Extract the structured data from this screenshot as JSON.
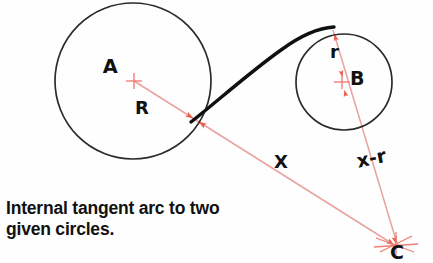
{
  "figure": {
    "title_caption": "Internal tangent arc to two\ngiven circles.",
    "background_color": "#fefefe",
    "line_color_construction": "#e8a2a0",
    "arrow_color": "#f0604f",
    "ink_color": "#1a1a1a",
    "circles": [
      {
        "name": "circle-A",
        "center_label": "A",
        "cx": 133,
        "cy": 81,
        "r": 78,
        "radius_label": "R"
      },
      {
        "name": "circle-B",
        "center_label": "B",
        "cx": 344,
        "cy": 82,
        "r": 48,
        "radius_label": "r"
      }
    ],
    "labels": {
      "center_a": "A",
      "radius_a": "R",
      "center_b": "B",
      "radius_b": "r",
      "distance_x": "X",
      "distance_x_minus_r": "x-r",
      "arc_center": "C"
    },
    "tangent_arc": {
      "name": "internal-tangent-arc",
      "tangent_point_a": {
        "x": 192,
        "y": 120
      },
      "tangent_point_b": {
        "x": 333,
        "y": 29
      },
      "arc_center": {
        "x": 396,
        "y": 248
      }
    },
    "construction_lines": [
      {
        "name": "line-A-to-C",
        "from": "A",
        "to": "C",
        "label": "X"
      },
      {
        "name": "line-B-to-C",
        "from": "B",
        "to": "C",
        "label": "x-r"
      }
    ]
  }
}
